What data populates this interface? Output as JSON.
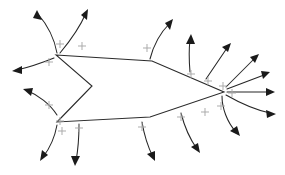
{
  "figure": {
    "type": "field-line-diagram",
    "width": 285,
    "height": 175,
    "background": "#ffffff",
    "stroke_color": "#2b2b2b",
    "charge_color": "#a8a8a8",
    "arrowhead_color": "#1a1a1a"
  },
  "conductor": {
    "name": "charged-conductor-outline",
    "closed": true,
    "vertices": [
      {
        "x": 56,
        "y": 55
      },
      {
        "x": 152,
        "y": 61
      },
      {
        "x": 224,
        "y": 92
      },
      {
        "x": 150,
        "y": 117
      },
      {
        "x": 57,
        "y": 122
      },
      {
        "x": 92,
        "y": 86
      }
    ],
    "notch": {
      "apex_x": 92,
      "apex_y": 86,
      "opens": "left"
    }
  },
  "charges": {
    "symbol": "+",
    "sign": "positive",
    "count": 16,
    "positions": [
      {
        "x": 60,
        "y": 44
      },
      {
        "x": 82,
        "y": 46
      },
      {
        "x": 147,
        "y": 48
      },
      {
        "x": 49,
        "y": 62
      },
      {
        "x": 49,
        "y": 105
      },
      {
        "x": 60,
        "y": 121
      },
      {
        "x": 62,
        "y": 131
      },
      {
        "x": 79,
        "y": 128
      },
      {
        "x": 142,
        "y": 127
      },
      {
        "x": 181,
        "y": 117
      },
      {
        "x": 205,
        "y": 112
      },
      {
        "x": 221,
        "y": 106
      },
      {
        "x": 191,
        "y": 74
      },
      {
        "x": 208,
        "y": 81
      },
      {
        "x": 223,
        "y": 86
      },
      {
        "x": 232,
        "y": 93
      }
    ]
  },
  "field_lines": {
    "count": 16,
    "direction": "outward",
    "description": "Curved lines with solid triangular arrowheads leaving the surface normal to the conductor",
    "items": [
      {
        "id": 1,
        "origin": "top-left-vertex",
        "heading": "up-left"
      },
      {
        "id": 2,
        "origin": "top-left-vertex",
        "heading": "up"
      },
      {
        "id": 3,
        "origin": "top-edge",
        "heading": "up-right"
      },
      {
        "id": 4,
        "origin": "left-upper-edge",
        "heading": "left"
      },
      {
        "id": 5,
        "origin": "left-lower-edge",
        "heading": "left"
      },
      {
        "id": 6,
        "origin": "bottom-left-vertex",
        "heading": "down-left"
      },
      {
        "id": 7,
        "origin": "bottom-edge",
        "heading": "down"
      },
      {
        "id": 8,
        "origin": "bottom-edge",
        "heading": "down"
      },
      {
        "id": 9,
        "origin": "bottom-right-edge",
        "heading": "down"
      },
      {
        "id": 10,
        "origin": "right-vertex",
        "heading": "down-right"
      },
      {
        "id": 11,
        "origin": "right-vertex",
        "heading": "right-down"
      },
      {
        "id": 12,
        "origin": "right-vertex",
        "heading": "right"
      },
      {
        "id": 13,
        "origin": "right-vertex",
        "heading": "right-up"
      },
      {
        "id": 14,
        "origin": "right-vertex",
        "heading": "up-right"
      },
      {
        "id": 15,
        "origin": "top-right-edge",
        "heading": "up-right"
      },
      {
        "id": 16,
        "origin": "top-right-edge",
        "heading": "up"
      }
    ]
  }
}
